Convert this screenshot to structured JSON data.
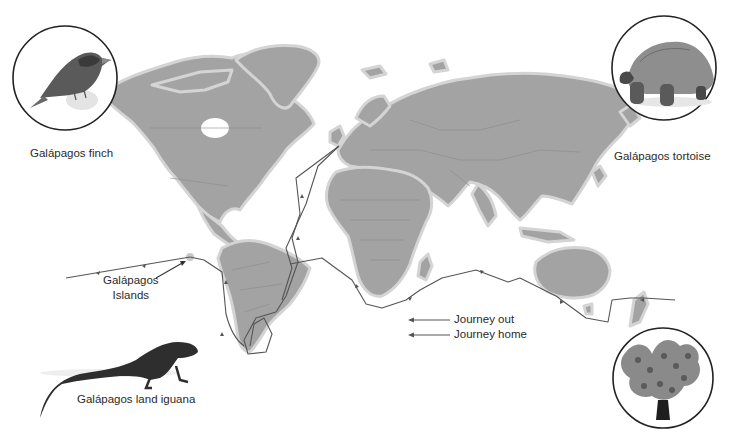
{
  "map": {
    "title": "Voyage of the Beagle",
    "land_color": "#a3a3a3",
    "coast_halo_color": "#d4d4d4",
    "route_color": "#555555",
    "background": "#ffffff"
  },
  "labels": {
    "galapagos_islands_line1": "Galápagos",
    "galapagos_islands_line2": "Islands"
  },
  "legend": {
    "items": [
      {
        "label": "Journey out",
        "arrow": "left-arrow"
      },
      {
        "label": "Journey home",
        "arrow": "left-arrow"
      }
    ]
  },
  "insets": [
    {
      "id": "finch",
      "caption": "Galápagos finch",
      "icon": "finch-icon"
    },
    {
      "id": "tortoise",
      "caption": "Galápagos tortoise",
      "icon": "tortoise-icon"
    },
    {
      "id": "iguana",
      "caption": "Galápagos land iguana",
      "icon": "iguana-icon"
    },
    {
      "id": "cactus",
      "caption": "",
      "icon": "prickly-pear-cactus-icon"
    }
  ]
}
